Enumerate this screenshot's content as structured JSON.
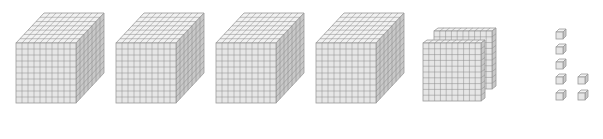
{
  "diagram": {
    "represented_value": 4207,
    "colors": {
      "front_face": "#e6e6e6",
      "top_face": "#f2f2f2",
      "side_face": "#c8c8c8",
      "grid_line": "#8a8a8a",
      "edge": "#9a9a9a"
    },
    "thousands": {
      "label": "thousand cubes",
      "count": 4,
      "items": [
        {
          "x": 16,
          "y": 43
        },
        {
          "x": 116,
          "y": 43
        },
        {
          "x": 216,
          "y": 43
        },
        {
          "x": 316,
          "y": 43
        }
      ],
      "size": 60,
      "depth_dx": 28,
      "depth_dy": -30,
      "grid": 10
    },
    "hundreds": {
      "label": "hundred flats",
      "count": 2,
      "items": [
        {
          "x": 434,
          "y": 31
        },
        {
          "x": 423,
          "y": 43
        }
      ],
      "size": 58,
      "depth_dx": 4,
      "depth_dy": -3,
      "grid": 10
    },
    "ones": {
      "label": "unit cubes",
      "count": 7,
      "items": [
        {
          "x": 556,
          "y": 32
        },
        {
          "x": 556,
          "y": 47
        },
        {
          "x": 556,
          "y": 62
        },
        {
          "x": 556,
          "y": 77
        },
        {
          "x": 578,
          "y": 77
        },
        {
          "x": 556,
          "y": 93
        },
        {
          "x": 578,
          "y": 93
        }
      ],
      "size": 7,
      "depth_dx": 3,
      "depth_dy": -3
    }
  }
}
